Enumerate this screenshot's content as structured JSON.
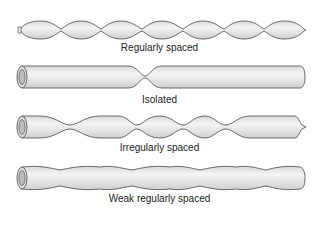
{
  "figure": {
    "colors": {
      "fill": "#e6e6e6",
      "highlight": "#f6f6f6",
      "stroke": "#6a6a6a",
      "text": "#222222"
    },
    "rows": [
      {
        "id": "regularly-spaced",
        "label": "Regularly spaced"
      },
      {
        "id": "isolated",
        "label": "Isolated"
      },
      {
        "id": "irregularly-spaced",
        "label": "Irregularly spaced"
      },
      {
        "id": "weak-regularly-spaced",
        "label": "Weak regularly spaced"
      }
    ]
  }
}
